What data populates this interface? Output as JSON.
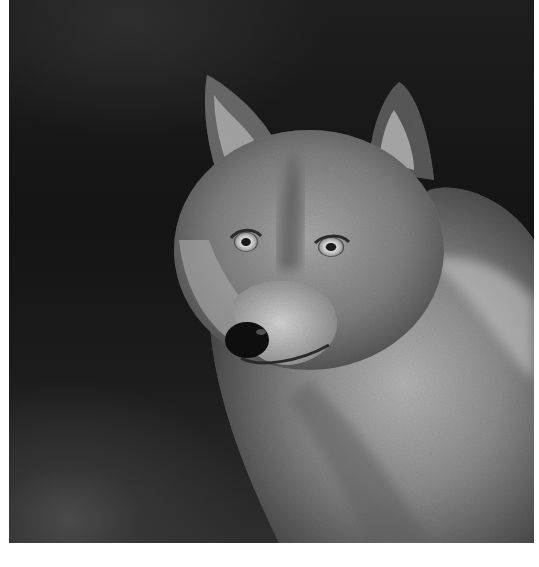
{
  "image": {
    "subject": "gray wolf portrait",
    "style": "black and white photograph",
    "background": "dark gradient",
    "colors": {
      "background_dark": "#161616",
      "fur_light": "#c8c8c8",
      "fur_mid": "#8a8a8a",
      "fur_dark": "#3c3c3c",
      "nose": "#0e0e0e",
      "eye": "#d6d6d6",
      "page_bg": "#ffffff"
    }
  }
}
